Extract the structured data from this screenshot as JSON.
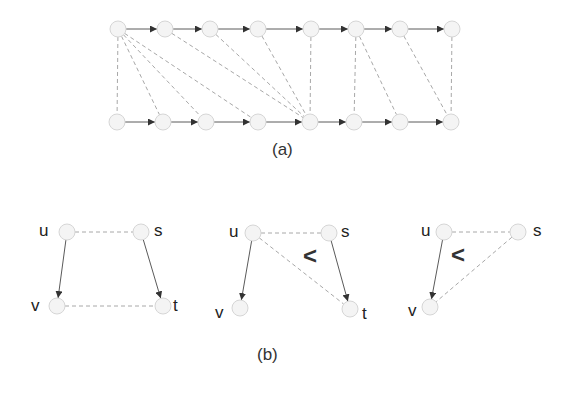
{
  "colors": {
    "node_fill": "#f4f4f4",
    "node_stroke": "#d6d6d6",
    "dashed_edge": "#a8a8a8",
    "solid_edge": "#5a5a5a",
    "arrow": "#333333",
    "text": "#222222"
  },
  "figure_a": {
    "caption": "(a)",
    "top_row": [
      {
        "id": "T0",
        "x": 118,
        "y": 29
      },
      {
        "id": "T1",
        "x": 165,
        "y": 29
      },
      {
        "id": "T2",
        "x": 210,
        "y": 29
      },
      {
        "id": "T3",
        "x": 258,
        "y": 29
      },
      {
        "id": "T4",
        "x": 311,
        "y": 29
      },
      {
        "id": "T5",
        "x": 356,
        "y": 29
      },
      {
        "id": "T6",
        "x": 400,
        "y": 29
      },
      {
        "id": "T7",
        "x": 452,
        "y": 29
      }
    ],
    "bottom_row": [
      {
        "id": "B0",
        "x": 117,
        "y": 122
      },
      {
        "id": "B1",
        "x": 163,
        "y": 122
      },
      {
        "id": "B2",
        "x": 206,
        "y": 122
      },
      {
        "id": "B3",
        "x": 258,
        "y": 122
      },
      {
        "id": "B4",
        "x": 310,
        "y": 122
      },
      {
        "id": "B5",
        "x": 354,
        "y": 122
      },
      {
        "id": "B6",
        "x": 400,
        "y": 122
      },
      {
        "id": "B7",
        "x": 451,
        "y": 122
      }
    ],
    "directed_edges": [
      [
        "T0",
        "T1"
      ],
      [
        "T1",
        "T2"
      ],
      [
        "T2",
        "T3"
      ],
      [
        "T3",
        "T4"
      ],
      [
        "T4",
        "T5"
      ],
      [
        "T5",
        "T6"
      ],
      [
        "T6",
        "T7"
      ],
      [
        "B0",
        "B1"
      ],
      [
        "B1",
        "B2"
      ],
      [
        "B2",
        "B3"
      ],
      [
        "B3",
        "B4"
      ],
      [
        "B4",
        "B5"
      ],
      [
        "B5",
        "B6"
      ],
      [
        "B6",
        "B7"
      ]
    ],
    "dashed_edges": [
      [
        "T0",
        "B0"
      ],
      [
        "T0",
        "B1"
      ],
      [
        "T0",
        "B2"
      ],
      [
        "T0",
        "B3"
      ],
      [
        "T1",
        "B4"
      ],
      [
        "T2",
        "B4"
      ],
      [
        "T3",
        "B4"
      ],
      [
        "T4",
        "B4"
      ],
      [
        "T5",
        "B5"
      ],
      [
        "T5",
        "B6"
      ],
      [
        "T6",
        "B7"
      ],
      [
        "T7",
        "B7"
      ]
    ]
  },
  "figure_b": {
    "caption": "(b)",
    "less_than_symbol": "<",
    "subfigures": [
      {
        "nodes": [
          {
            "id": "u",
            "label": "u",
            "x": 67,
            "y": 232,
            "label_x": 39,
            "label_y": 222
          },
          {
            "id": "s",
            "label": "s",
            "x": 141,
            "y": 232,
            "label_x": 154,
            "label_y": 222
          },
          {
            "id": "v",
            "label": "v",
            "x": 57,
            "y": 306,
            "label_x": 31,
            "label_y": 297
          },
          {
            "id": "t",
            "label": "t",
            "x": 163,
            "y": 306,
            "label_x": 173,
            "label_y": 297
          }
        ],
        "directed_edges": [
          [
            "u",
            "v"
          ],
          [
            "s",
            "t"
          ]
        ],
        "dashed_edges": [
          [
            "u",
            "s"
          ],
          [
            "v",
            "t"
          ]
        ],
        "less_than": null
      },
      {
        "nodes": [
          {
            "id": "u",
            "label": "u",
            "x": 253,
            "y": 233,
            "label_x": 229,
            "label_y": 223
          },
          {
            "id": "s",
            "label": "s",
            "x": 329,
            "y": 233,
            "label_x": 341,
            "label_y": 223
          },
          {
            "id": "v",
            "label": "v",
            "x": 240,
            "y": 308,
            "label_x": 215,
            "label_y": 304
          },
          {
            "id": "t",
            "label": "t",
            "x": 350,
            "y": 309,
            "label_x": 362,
            "label_y": 305
          }
        ],
        "directed_edges": [
          [
            "u",
            "v"
          ],
          [
            "s",
            "t"
          ]
        ],
        "dashed_edges": [
          [
            "u",
            "s"
          ],
          [
            "u",
            "t"
          ]
        ],
        "less_than": {
          "x": 303,
          "y": 244
        }
      },
      {
        "nodes": [
          {
            "id": "u",
            "label": "u",
            "x": 444,
            "y": 232,
            "label_x": 421,
            "label_y": 222
          },
          {
            "id": "s",
            "label": "s",
            "x": 518,
            "y": 232,
            "label_x": 533,
            "label_y": 222
          },
          {
            "id": "v",
            "label": "v",
            "x": 430,
            "y": 307,
            "label_x": 408,
            "label_y": 302
          }
        ],
        "directed_edges": [
          [
            "u",
            "v"
          ]
        ],
        "dashed_edges": [
          [
            "u",
            "s"
          ],
          [
            "s",
            "v"
          ]
        ],
        "less_than": {
          "x": 451,
          "y": 243
        }
      }
    ]
  }
}
